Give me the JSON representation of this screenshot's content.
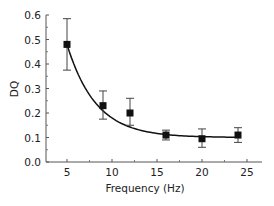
{
  "chart_data": {
    "type": "scatter",
    "title": "",
    "xlabel": "Frequency (Hz)",
    "ylabel": "DQ",
    "xlim": [
      2,
      28
    ],
    "ylim": [
      0.0,
      0.6
    ],
    "xticks": [
      5,
      10,
      15,
      20,
      25
    ],
    "xtick_labels": [
      "5",
      "10",
      "15",
      "20",
      "25"
    ],
    "yticks": [
      0.0,
      0.1,
      0.2,
      0.3,
      0.4,
      0.5,
      0.6
    ],
    "ytick_labels": [
      "0.0",
      "0.1",
      "0.2",
      "0.3",
      "0.4",
      "0.5",
      "0.6"
    ],
    "grid": false,
    "legend": null,
    "series": [
      {
        "name": "DQ measurements",
        "marker": "square",
        "x": [
          5,
          9,
          12,
          16,
          20,
          24
        ],
        "y": [
          0.48,
          0.23,
          0.2,
          0.11,
          0.095,
          0.11
        ],
        "err_low": [
          0.375,
          0.175,
          0.15,
          0.09,
          0.06,
          0.08
        ],
        "err_high": [
          0.585,
          0.29,
          0.26,
          0.13,
          0.135,
          0.14
        ]
      },
      {
        "name": "Exponential fit",
        "line": "solid",
        "x": [
          5,
          6,
          7,
          8,
          9,
          10,
          11,
          12,
          13,
          14,
          15,
          16,
          17,
          18,
          19,
          20,
          21,
          22,
          23,
          24
        ],
        "y": [
          0.48,
          0.39,
          0.32,
          0.268,
          0.228,
          0.197,
          0.173,
          0.155,
          0.141,
          0.131,
          0.123,
          0.117,
          0.112,
          0.109,
          0.106,
          0.104,
          0.103,
          0.102,
          0.101,
          0.1
        ]
      }
    ]
  }
}
